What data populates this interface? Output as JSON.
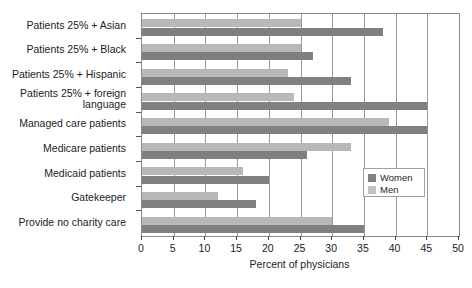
{
  "chart_data": {
    "type": "bar",
    "orientation": "horizontal",
    "title": "",
    "xlabel": "Percent of physicians",
    "ylabel": "",
    "xlim": [
      0,
      50
    ],
    "xticks": [
      0,
      5,
      10,
      15,
      20,
      25,
      30,
      35,
      40,
      45,
      50
    ],
    "grid": true,
    "legend_position": "inside-right",
    "categories": [
      "Patients 25% + Asian",
      "Patients 25% + Black",
      "Patients 25% + Hispanic",
      "Patients 25% + foreign\nlanguage",
      "Managed care patients",
      "Medicare patients",
      "Medicaid patients",
      "Gatekeeper",
      "Provide no charity care"
    ],
    "series": [
      {
        "name": "Women",
        "color": "#808080",
        "values": [
          38,
          27,
          33,
          45,
          45,
          26,
          20,
          18,
          35
        ]
      },
      {
        "name": "Men",
        "color": "#b8b8b8",
        "values": [
          25,
          25,
          23,
          24,
          39,
          33,
          16,
          12,
          30
        ]
      }
    ]
  },
  "legend": {
    "items": [
      {
        "label": "Women"
      },
      {
        "label": "Men"
      }
    ]
  }
}
